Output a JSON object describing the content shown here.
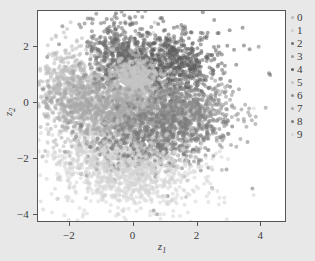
{
  "chart_data": {
    "type": "scatter",
    "title": "",
    "xlabel": "z1",
    "ylabel": "z2",
    "xlim": [
      -3.0,
      4.8
    ],
    "ylim": [
      -4.3,
      3.3
    ],
    "xticks": [
      -2,
      0,
      2,
      4
    ],
    "xticklabels": [
      "−2",
      "0",
      "2",
      "4"
    ],
    "yticks": [
      2,
      0,
      -2,
      -4
    ],
    "yticklabels": [
      "2",
      "0",
      "−2",
      "−4"
    ],
    "grid": false,
    "legend_position": "right",
    "marker_size": 2.0,
    "marker_opacity": 0.55,
    "background_color": "#e8e8e8",
    "axes_facecolor": "#ffffff",
    "axes_edgecolor": "#55565a",
    "text_color": "#3a3b3e",
    "series": [
      {
        "name": "0",
        "color": "#b9b9b9",
        "n": 620,
        "center": [
          -1.95,
          0.55
        ],
        "spread": [
          0.62,
          0.78
        ],
        "rot": 20
      },
      {
        "name": "1",
        "color": "#cfcfcf",
        "n": 700,
        "center": [
          -0.7,
          -1.85
        ],
        "spread": [
          0.95,
          0.72
        ],
        "rot": -8
      },
      {
        "name": "2",
        "color": "#6e6e6e",
        "n": 640,
        "center": [
          -0.35,
          1.55
        ],
        "spread": [
          0.52,
          0.74
        ],
        "rot": 12
      },
      {
        "name": "3",
        "color": "#9a9a9a",
        "n": 600,
        "center": [
          0.3,
          -0.15
        ],
        "spread": [
          0.7,
          0.48
        ],
        "rot": 5
      },
      {
        "name": "4",
        "color": "#5e5e5e",
        "n": 660,
        "center": [
          1.25,
          1.35
        ],
        "spread": [
          0.66,
          0.62
        ],
        "rot": -15
      },
      {
        "name": "5",
        "color": "#c4c4c4",
        "n": 580,
        "center": [
          0.05,
          0.75
        ],
        "spread": [
          0.42,
          0.42
        ],
        "rot": 0
      },
      {
        "name": "6",
        "color": "#8c8c8c",
        "n": 610,
        "center": [
          1.6,
          -0.3
        ],
        "spread": [
          0.78,
          0.58
        ],
        "rot": 10
      },
      {
        "name": "7",
        "color": "#a8a8a8",
        "n": 630,
        "center": [
          -1.15,
          -0.35
        ],
        "spread": [
          0.8,
          0.62
        ],
        "rot": -22
      },
      {
        "name": "8",
        "color": "#7a7a7a",
        "n": 590,
        "center": [
          0.75,
          -1.3
        ],
        "spread": [
          0.88,
          0.52
        ],
        "rot": 8
      },
      {
        "name": "9",
        "color": "#d6d6d6",
        "n": 700,
        "center": [
          0.1,
          -2.55
        ],
        "spread": [
          1.05,
          0.68
        ],
        "rot": 3
      }
    ]
  },
  "legend": {
    "items": [
      {
        "label": "0"
      },
      {
        "label": "1"
      },
      {
        "label": "2"
      },
      {
        "label": "3"
      },
      {
        "label": "4"
      },
      {
        "label": "5"
      },
      {
        "label": "6"
      },
      {
        "label": "7"
      },
      {
        "label": "8"
      },
      {
        "label": "9"
      }
    ]
  }
}
